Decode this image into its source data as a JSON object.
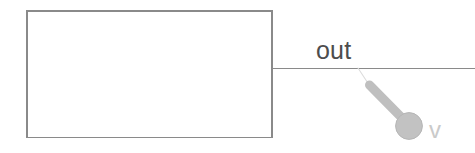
{
  "canvas": {
    "width": 475,
    "height": 153,
    "background_color": "#ffffff"
  },
  "diagram": {
    "title": "",
    "block": {
      "label": "",
      "x": 26,
      "y": 10,
      "width": 247,
      "height": 128,
      "stroke_color": "#8a8a8a",
      "fill_color": "#ffffff",
      "stroke_width": 1.6
    },
    "wire": {
      "label": "out",
      "x1": 273,
      "y1": 68,
      "x2": 475,
      "y2": 68,
      "stroke_color": "#8a8a8a",
      "stroke_width": 1.6
    },
    "probe": {
      "name": "probe-pin",
      "leader_line": {
        "x1": 358,
        "y1": 68,
        "x2": 369,
        "y2": 85,
        "stroke_color": "#d8d8d8",
        "stroke_width": 1
      },
      "shaft": {
        "x1": 369,
        "y1": 85,
        "x2": 404,
        "y2": 120,
        "stroke_color": "#bfbfbf",
        "stroke_width": 9
      },
      "head": {
        "cx": 409,
        "cy": 126,
        "r": 13.5,
        "fill_color": "#c2c2c2",
        "stroke_color": "#b4b4b4"
      },
      "annotation": "v"
    }
  }
}
